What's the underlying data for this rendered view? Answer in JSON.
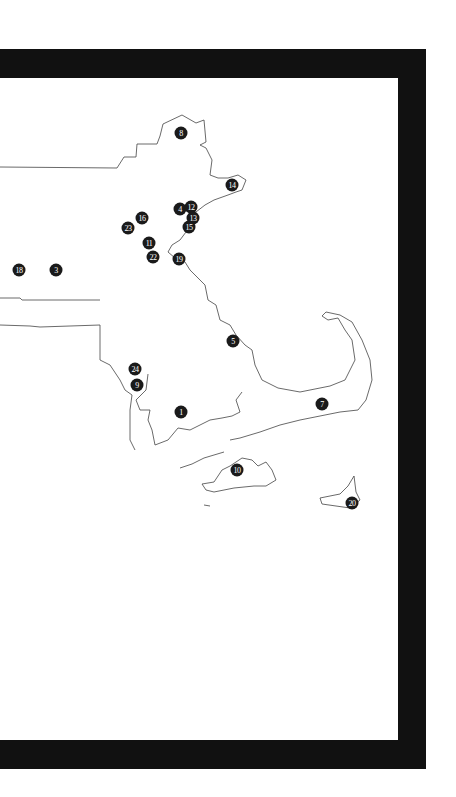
{
  "map": {
    "region": "Eastern Massachusetts",
    "background": "#ffffff",
    "outline_color": "#444444",
    "frame_color": "#111111",
    "marker_color": "#1a1a1a",
    "markers": [
      {
        "label": "8",
        "x": 181,
        "y": 133
      },
      {
        "label": "14",
        "x": 232,
        "y": 185
      },
      {
        "label": "4",
        "x": 180,
        "y": 209
      },
      {
        "label": "12",
        "x": 191,
        "y": 207
      },
      {
        "label": "13",
        "x": 193,
        "y": 218
      },
      {
        "label": "16",
        "x": 142,
        "y": 218
      },
      {
        "label": "15",
        "x": 189,
        "y": 227
      },
      {
        "label": "23",
        "x": 128,
        "y": 228
      },
      {
        "label": "11",
        "x": 149,
        "y": 243
      },
      {
        "label": "22",
        "x": 153,
        "y": 257
      },
      {
        "label": "19",
        "x": 179,
        "y": 259
      },
      {
        "label": "18",
        "x": 19,
        "y": 270
      },
      {
        "label": "3",
        "x": 56,
        "y": 270
      },
      {
        "label": "5",
        "x": 233,
        "y": 341
      },
      {
        "label": "24",
        "x": 135,
        "y": 369
      },
      {
        "label": "9",
        "x": 137,
        "y": 385
      },
      {
        "label": "7",
        "x": 322,
        "y": 404
      },
      {
        "label": "1",
        "x": 181,
        "y": 412
      },
      {
        "label": "10",
        "x": 237,
        "y": 470
      },
      {
        "label": "20",
        "x": 352,
        "y": 503
      }
    ]
  }
}
